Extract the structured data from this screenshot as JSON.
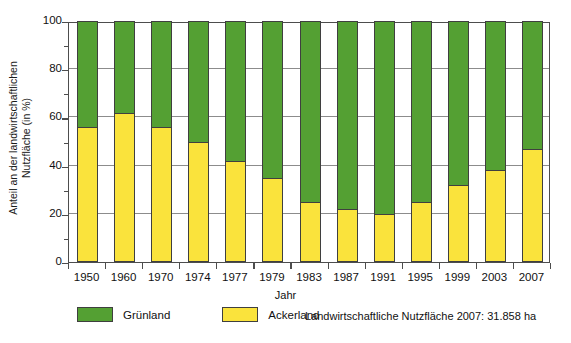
{
  "chart_data": {
    "type": "bar",
    "subtype": "stacked-100-percent",
    "title": "",
    "xlabel": "Jahr",
    "ylabel": "Anteil an der landwirtschaftlichen Nutzfläche (in %)",
    "ylabel_lines": [
      "Anteil an der landwirtschaftlichen",
      "Nutzfläche (in %)"
    ],
    "ylim": [
      0,
      100
    ],
    "yticks": [
      0,
      20,
      40,
      60,
      80,
      100
    ],
    "ytick_labels": [
      "0",
      "20",
      "40",
      "60",
      "80",
      "100"
    ],
    "grid": true,
    "grid_axis": "y",
    "legend_position": "bottom-left",
    "categories": [
      "1950",
      "1960",
      "1970",
      "1974",
      "1977",
      "1979",
      "1983",
      "1987",
      "1991",
      "1995",
      "1999",
      "2003",
      "2007"
    ],
    "series": [
      {
        "name": "Grünland",
        "color": "#54a033",
        "values": [
          44,
          38,
          44,
          50,
          58,
          65,
          75,
          78,
          80,
          75,
          68,
          62,
          53
        ]
      },
      {
        "name": "Ackerland",
        "color": "#fae33c",
        "values": [
          56,
          62,
          56,
          50,
          42,
          35,
          25,
          22,
          20,
          25,
          32,
          38,
          47
        ]
      }
    ],
    "annotation": "Landwirtschaftliche Nutzfläche 2007: 31.858 ha"
  },
  "axes": {
    "y_title_line1": "Anteil an der landwirtschaftlichen",
    "y_title_line2": "Nutzfläche (in %)",
    "x_title": "Jahr"
  },
  "legend": {
    "items": [
      {
        "label": "Grünland",
        "color": "#54a033"
      },
      {
        "label": "Ackerland",
        "color": "#fae33c"
      }
    ]
  },
  "footnote": {
    "text": "Landwirtschaftliche Nutzfläche 2007: 31.858 ha"
  },
  "colors": {
    "gruenland": "#54a033",
    "ackerland": "#fae33c",
    "axis": "#4d4d4d",
    "grid": "#8c8c8c",
    "background": "#ffffff"
  }
}
